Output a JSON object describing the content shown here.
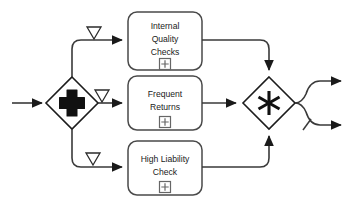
{
  "diagram": {
    "type": "bpmn-process-fragment",
    "background_color": "#ffffff",
    "line_color": "#3a3a3a",
    "shape_fill": "#ffffff",
    "shape_stroke": "#4a4a4a",
    "gateway_stroke": "#1c1c1c",
    "glyph_color": "#111111"
  },
  "gateways": {
    "split": {
      "name": "parallel-gateway-split",
      "glyph": "plus-icon",
      "kind": "parallel",
      "label": ""
    },
    "merge": {
      "name": "complex-gateway-merge",
      "glyph": "asterisk-icon",
      "kind": "complex",
      "label": ""
    }
  },
  "tasks": [
    {
      "id": "internal-quality-checks",
      "lines": [
        "Internal",
        "Quality",
        "Checks"
      ],
      "marker": "subprocess-plus-icon"
    },
    {
      "id": "frequent-returns",
      "lines": [
        "Frequent",
        "Returns"
      ],
      "marker": "subprocess-plus-icon"
    },
    {
      "id": "high-liability-check",
      "lines": [
        "High Liability",
        "Check"
      ],
      "marker": "subprocess-plus-icon"
    }
  ],
  "branch_markers": [
    {
      "id": "branch-marker-top",
      "glyph": "hollow-down-triangle-icon"
    },
    {
      "id": "branch-marker-middle",
      "glyph": "hollow-down-triangle-icon"
    },
    {
      "id": "branch-marker-bottom",
      "glyph": "hollow-down-triangle-icon"
    }
  ],
  "flows": {
    "incoming": {
      "id": "incoming-sequence-flow",
      "label": ""
    },
    "outgoing_upper": {
      "id": "outgoing-sequence-flow-upper",
      "label": ""
    },
    "outgoing_lower": {
      "id": "outgoing-sequence-flow-lower",
      "label": "",
      "marker": "default-flow-slash-icon"
    }
  }
}
